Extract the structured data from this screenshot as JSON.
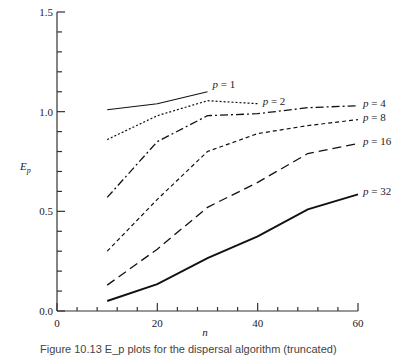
{
  "chart_data": {
    "type": "line",
    "title": "",
    "xlabel": "n",
    "ylabel": "E_p",
    "xlim": [
      0,
      60
    ],
    "ylim": [
      0.0,
      1.5
    ],
    "x_ticks": [
      0,
      20,
      40,
      60
    ],
    "y_ticks": [
      0.0,
      0.5,
      1.0,
      1.5
    ],
    "x_tick_labels": [
      "0",
      "20",
      "40",
      "60"
    ],
    "y_tick_labels": [
      "0.0",
      "0.5",
      "1.0",
      "1.5"
    ],
    "x_minor_step": 4,
    "y_minor_step": 0.1,
    "grid": false,
    "legend_position": "inline labels at line ends",
    "series": [
      {
        "name": "p = 1",
        "style": "solid",
        "x": [
          10,
          20,
          30
        ],
        "values": [
          1.01,
          1.04,
          1.1
        ]
      },
      {
        "name": "p = 2",
        "style": "dotted",
        "x": [
          10,
          20,
          30,
          40
        ],
        "values": [
          0.86,
          0.98,
          1.055,
          1.04
        ]
      },
      {
        "name": "p = 4",
        "style": "dash-dot",
        "x": [
          10,
          20,
          30,
          40,
          50,
          60
        ],
        "values": [
          0.57,
          0.85,
          0.98,
          0.99,
          1.02,
          1.03
        ]
      },
      {
        "name": "p = 8",
        "style": "short-dash",
        "x": [
          10,
          20,
          30,
          40,
          50,
          60
        ],
        "values": [
          0.3,
          0.56,
          0.8,
          0.89,
          0.93,
          0.96
        ]
      },
      {
        "name": "p = 16",
        "style": "long-dash",
        "x": [
          10,
          20,
          30,
          40,
          50,
          60
        ],
        "values": [
          0.13,
          0.31,
          0.52,
          0.645,
          0.79,
          0.84
        ]
      },
      {
        "name": "p = 32",
        "style": "solid-thick",
        "x": [
          10,
          20,
          30,
          40,
          50,
          60
        ],
        "values": [
          0.05,
          0.135,
          0.265,
          0.375,
          0.51,
          0.585
        ]
      }
    ]
  },
  "labels": {
    "p1": {
      "var": "p",
      "rest": " = 1"
    },
    "p2": {
      "var": "p",
      "rest": " = 2"
    },
    "p4": {
      "var": "p",
      "rest": " = 4"
    },
    "p8": {
      "var": "p",
      "rest": " = 8"
    },
    "p16": {
      "var": "p",
      "rest": " = 16"
    },
    "p32": {
      "var": "p",
      "rest": " = 32"
    },
    "ylabel_main": "E",
    "ylabel_sub": "p",
    "xlabel": "n"
  },
  "caption": "Figure 10.13   E_p plots for the dispersal algorithm (truncated)"
}
